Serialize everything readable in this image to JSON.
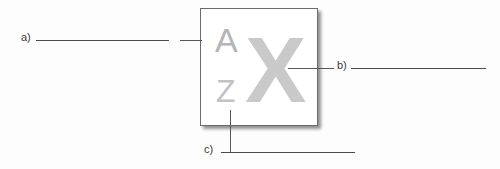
{
  "diagram": {
    "type": "labeled-figure-worksheet",
    "figure": {
      "name": "font-style-icon-box",
      "glyphs": {
        "small_top": "A",
        "small_bottom": "Z",
        "large": "X"
      }
    },
    "callouts": [
      {
        "id": "a",
        "label": "a)",
        "answer": "",
        "side": "left",
        "points_to": "small_top"
      },
      {
        "id": "b",
        "label": "b)",
        "answer": "",
        "side": "right",
        "points_to": "large"
      },
      {
        "id": "c",
        "label": "c)",
        "answer": "",
        "side": "bottom",
        "points_to": "small_bottom"
      }
    ]
  },
  "colors": {
    "background": "#fdfdfd",
    "box_border": "#6b6b6b",
    "glyph_small": "#b9b9b9",
    "glyph_large": "#c9c9c9",
    "line": "#4a4a4a",
    "label_text": "#3a3a3a"
  }
}
